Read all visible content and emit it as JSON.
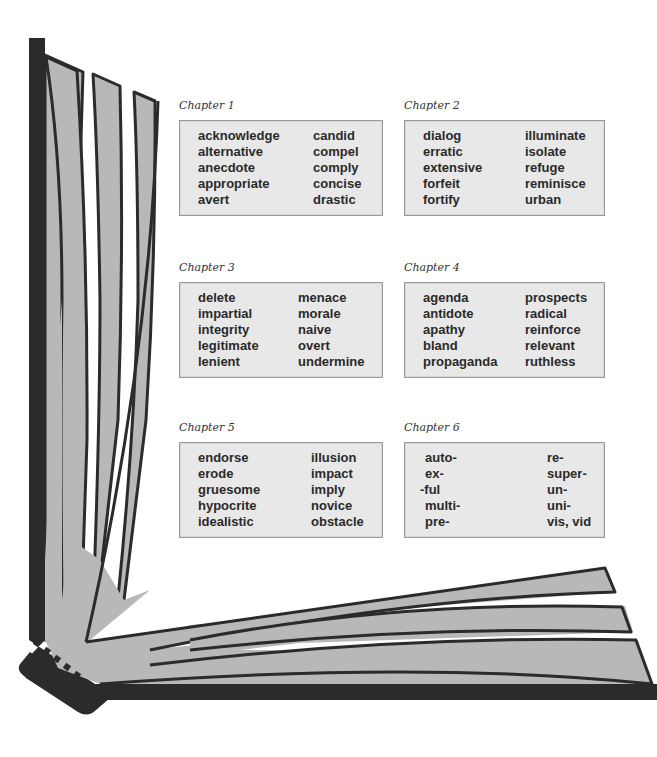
{
  "colors": {
    "cover": "#2b2b2b",
    "page_fill": "#b8b8b8",
    "page_outline": "#2b2b2b",
    "box_fill": "#e8e8e8",
    "box_border": "#9a9a9a",
    "text": "#2a2a2a"
  },
  "illustration": {
    "name": "open-book-icon",
    "description": "Open book viewed from the spine corner with fanned gray pages"
  },
  "chapters": [
    {
      "title": "Chapter 1",
      "left_words": [
        "acknowledge",
        "alternative",
        "anecdote",
        "appropriate",
        "avert"
      ],
      "right_words": [
        "candid",
        "compel",
        "comply",
        "concise",
        "drastic"
      ]
    },
    {
      "title": "Chapter 2",
      "left_words": [
        "dialog",
        "erratic",
        "extensive",
        "forfeit",
        "fortify"
      ],
      "right_words": [
        "illuminate",
        "isolate",
        "refuge",
        "reminisce",
        "urban"
      ]
    },
    {
      "title": "Chapter 3",
      "left_words": [
        "delete",
        "impartial",
        "integrity",
        "legitimate",
        "lenient"
      ],
      "right_words": [
        "menace",
        "morale",
        "naive",
        "overt",
        "undermine"
      ]
    },
    {
      "title": "Chapter 4",
      "left_words": [
        "agenda",
        "antidote",
        "apathy",
        "bland",
        "propaganda"
      ],
      "right_words": [
        "prospects",
        "radical",
        "reinforce",
        "relevant",
        "ruthless"
      ]
    },
    {
      "title": "Chapter 5",
      "left_words": [
        "endorse",
        "erode",
        "gruesome",
        "hypocrite",
        "idealistic"
      ],
      "right_words": [
        "illusion",
        "impact",
        "imply",
        "novice",
        "obstacle"
      ]
    },
    {
      "title": "Chapter 6",
      "left_words": [
        "auto-",
        "ex-",
        "-ful",
        "multi-",
        "pre-"
      ],
      "right_words": [
        "re-",
        "super-",
        "un-",
        "uni-",
        "vis, vid"
      ]
    }
  ]
}
